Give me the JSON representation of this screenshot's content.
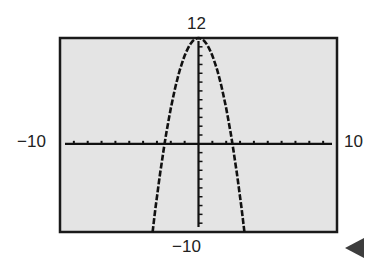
{
  "chart_data": {
    "type": "line",
    "title": "",
    "function": "y = -2x^2 + 12",
    "xlim": [
      -10,
      10
    ],
    "ylim": [
      -10,
      12
    ],
    "xscale": 1,
    "yscale": 1,
    "grid": false,
    "window_labels": {
      "ymax": "12",
      "ymin": "−10",
      "xmin": "−10",
      "xmax": "10"
    },
    "series": [
      {
        "name": "parabola",
        "x": [
          -3.32,
          -3,
          -2.449,
          -2,
          -1,
          0,
          1,
          2,
          2.449,
          3,
          3.32
        ],
        "y": [
          -10,
          -6,
          0,
          4,
          10,
          12,
          10,
          4,
          0,
          -6,
          -10
        ]
      }
    ],
    "x_intercepts": [
      -2.449,
      2.449
    ],
    "vertex": [
      0,
      12
    ]
  },
  "colors": {
    "screen": "#e4e4e4",
    "frame": "#1a1a1a",
    "curve": "#111111",
    "arrow": "#3d3d3d"
  },
  "nav": {
    "icon": "triangle-left-icon"
  }
}
